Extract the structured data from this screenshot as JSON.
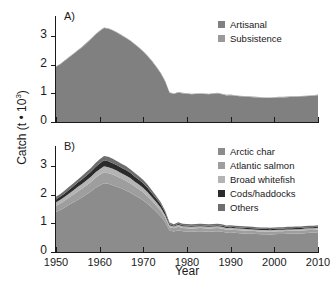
{
  "figure": {
    "axis_title_y": "Catch (t • 10",
    "axis_title_y_exp": "3",
    "axis_title_y_close": ")",
    "axis_title_x": "Year",
    "background": "#ffffff",
    "text_color": "#1a1a1a"
  },
  "panels": [
    {
      "id": "A",
      "label": "A)",
      "ytick_labels": [
        "0",
        "1",
        "2",
        "3"
      ],
      "xtick_labels": [
        "1950",
        "1960",
        "1970",
        "1980",
        "1990",
        "2000",
        "2010"
      ],
      "legend": [
        {
          "label": "Artisanal",
          "color": "#808080"
        },
        {
          "label": "Subsistence",
          "color": "#9a9a9a"
        }
      ]
    },
    {
      "id": "B",
      "label": "B)",
      "ytick_labels": [
        "0",
        "1",
        "2",
        "3"
      ],
      "xtick_labels": [
        "1950",
        "1960",
        "1970",
        "1980",
        "1990",
        "2000",
        "2010"
      ],
      "legend": [
        {
          "label": "Arctic char",
          "color": "#8c8c8c"
        },
        {
          "label": "Atlantic salmon",
          "color": "#9e9e9e"
        },
        {
          "label": "Broad whitefish",
          "color": "#b4b4b4"
        },
        {
          "label": "Cods/haddocks",
          "color": "#2b2b2b"
        },
        {
          "label": "Others",
          "color": "#6e6e6e"
        }
      ]
    }
  ],
  "chart_data": {
    "type": "area",
    "title": "",
    "xlabel": "Year",
    "ylabel": "Catch (t • 10^3)",
    "xlim": [
      1950,
      2010
    ],
    "ylim": [
      0,
      3.5
    ],
    "yticks": [
      0,
      1,
      2,
      3
    ],
    "xticks": [
      1950,
      1960,
      1970,
      1980,
      1990,
      2000,
      2010
    ],
    "grid": false,
    "legend_position": "top-right",
    "panels": [
      {
        "panel": "A",
        "label": "A)",
        "stacked": true,
        "x": [
          1950,
          1951,
          1952,
          1953,
          1954,
          1955,
          1956,
          1957,
          1958,
          1959,
          1960,
          1961,
          1962,
          1963,
          1964,
          1965,
          1966,
          1967,
          1968,
          1969,
          1970,
          1971,
          1972,
          1973,
          1974,
          1975,
          1976,
          1977,
          1978,
          1979,
          1980,
          1981,
          1982,
          1983,
          1984,
          1985,
          1986,
          1987,
          1988,
          1989,
          1990,
          1991,
          1992,
          1993,
          1994,
          1995,
          1996,
          1997,
          1998,
          1999,
          2000,
          2001,
          2002,
          2003,
          2004,
          2005,
          2006,
          2007,
          2008,
          2009,
          2010
        ],
        "series": [
          {
            "name": "Artisanal",
            "color": "#808080",
            "values": [
              1.93,
              2.02,
              2.14,
              2.26,
              2.38,
              2.5,
              2.62,
              2.76,
              2.9,
              3.05,
              3.18,
              3.29,
              3.26,
              3.2,
              3.12,
              3.03,
              2.94,
              2.84,
              2.72,
              2.6,
              2.46,
              2.3,
              2.12,
              1.92,
              1.7,
              1.42,
              1.02,
              0.98,
              1.03,
              1.0,
              0.99,
              0.97,
              0.98,
              0.99,
              0.98,
              0.97,
              0.99,
              1.0,
              0.97,
              0.93,
              0.94,
              0.92,
              0.9,
              0.89,
              0.88,
              0.87,
              0.86,
              0.85,
              0.84,
              0.84,
              0.85,
              0.86,
              0.86,
              0.87,
              0.88,
              0.88,
              0.89,
              0.9,
              0.91,
              0.92,
              0.94
            ]
          },
          {
            "name": "Subsistence",
            "color": "#9a9a9a",
            "values": [
              0.02,
              0.02,
              0.02,
              0.02,
              0.02,
              0.02,
              0.02,
              0.02,
              0.02,
              0.02,
              0.02,
              0.02,
              0.02,
              0.02,
              0.02,
              0.02,
              0.02,
              0.02,
              0.02,
              0.02,
              0.02,
              0.02,
              0.02,
              0.02,
              0.02,
              0.02,
              0.02,
              0.02,
              0.02,
              0.02,
              0.02,
              0.02,
              0.02,
              0.02,
              0.02,
              0.02,
              0.02,
              0.02,
              0.02,
              0.02,
              0.02,
              0.02,
              0.02,
              0.02,
              0.02,
              0.02,
              0.02,
              0.02,
              0.02,
              0.02,
              0.02,
              0.02,
              0.02,
              0.02,
              0.02,
              0.02,
              0.02,
              0.02,
              0.02,
              0.02,
              0.02
            ]
          }
        ]
      },
      {
        "panel": "B",
        "label": "B)",
        "stacked": true,
        "x": [
          1950,
          1951,
          1952,
          1953,
          1954,
          1955,
          1956,
          1957,
          1958,
          1959,
          1960,
          1961,
          1962,
          1963,
          1964,
          1965,
          1966,
          1967,
          1968,
          1969,
          1970,
          1971,
          1972,
          1973,
          1974,
          1975,
          1976,
          1977,
          1978,
          1979,
          1980,
          1981,
          1982,
          1983,
          1984,
          1985,
          1986,
          1987,
          1988,
          1989,
          1990,
          1991,
          1992,
          1993,
          1994,
          1995,
          1996,
          1997,
          1998,
          1999,
          2000,
          2001,
          2002,
          2003,
          2004,
          2005,
          2006,
          2007,
          2008,
          2009,
          2010
        ],
        "series": [
          {
            "name": "Arctic char",
            "color": "#8c8c8c",
            "values": [
              1.4,
              1.47,
              1.56,
              1.65,
              1.74,
              1.83,
              1.92,
              2.02,
              2.12,
              2.24,
              2.33,
              2.41,
              2.39,
              2.34,
              2.28,
              2.22,
              2.15,
              2.08,
              1.99,
              1.9,
              1.8,
              1.68,
              1.55,
              1.4,
              1.24,
              1.04,
              0.75,
              0.72,
              0.76,
              0.73,
              0.72,
              0.71,
              0.72,
              0.73,
              0.72,
              0.71,
              0.72,
              0.73,
              0.71,
              0.68,
              0.69,
              0.67,
              0.66,
              0.65,
              0.64,
              0.64,
              0.63,
              0.62,
              0.62,
              0.61,
              0.62,
              0.63,
              0.63,
              0.64,
              0.64,
              0.65,
              0.65,
              0.66,
              0.67,
              0.67,
              0.69
            ]
          },
          {
            "name": "Atlantic salmon",
            "color": "#9e9e9e",
            "values": [
              0.22,
              0.23,
              0.24,
              0.26,
              0.27,
              0.29,
              0.3,
              0.32,
              0.33,
              0.35,
              0.37,
              0.38,
              0.37,
              0.37,
              0.36,
              0.35,
              0.34,
              0.33,
              0.31,
              0.3,
              0.28,
              0.26,
              0.24,
              0.22,
              0.2,
              0.16,
              0.12,
              0.11,
              0.12,
              0.11,
              0.11,
              0.11,
              0.11,
              0.11,
              0.11,
              0.11,
              0.11,
              0.11,
              0.11,
              0.1,
              0.1,
              0.1,
              0.1,
              0.1,
              0.1,
              0.1,
              0.1,
              0.1,
              0.1,
              0.1,
              0.1,
              0.1,
              0.1,
              0.1,
              0.1,
              0.1,
              0.1,
              0.1,
              0.1,
              0.1,
              0.1
            ]
          },
          {
            "name": "Broad whitefish",
            "color": "#b4b4b4",
            "values": [
              0.12,
              0.13,
              0.13,
              0.14,
              0.15,
              0.16,
              0.17,
              0.17,
              0.18,
              0.19,
              0.2,
              0.21,
              0.21,
              0.2,
              0.2,
              0.19,
              0.19,
              0.18,
              0.17,
              0.16,
              0.16,
              0.15,
              0.13,
              0.12,
              0.11,
              0.09,
              0.07,
              0.06,
              0.07,
              0.06,
              0.06,
              0.06,
              0.06,
              0.06,
              0.06,
              0.06,
              0.06,
              0.06,
              0.06,
              0.06,
              0.06,
              0.06,
              0.06,
              0.06,
              0.06,
              0.05,
              0.05,
              0.05,
              0.05,
              0.05,
              0.05,
              0.05,
              0.05,
              0.05,
              0.05,
              0.05,
              0.05,
              0.06,
              0.06,
              0.06,
              0.06
            ]
          },
          {
            "name": "Cods/haddocks",
            "color": "#2b2b2b",
            "values": [
              0.1,
              0.11,
              0.12,
              0.13,
              0.14,
              0.15,
              0.16,
              0.17,
              0.18,
              0.19,
              0.2,
              0.21,
              0.21,
              0.2,
              0.2,
              0.19,
              0.19,
              0.18,
              0.17,
              0.17,
              0.16,
              0.15,
              0.13,
              0.12,
              0.11,
              0.09,
              0.04,
              0.03,
              0.04,
              0.04,
              0.04,
              0.04,
              0.04,
              0.04,
              0.04,
              0.04,
              0.04,
              0.04,
              0.04,
              0.04,
              0.04,
              0.04,
              0.04,
              0.04,
              0.04,
              0.04,
              0.04,
              0.04,
              0.04,
              0.04,
              0.04,
              0.04,
              0.04,
              0.04,
              0.04,
              0.04,
              0.04,
              0.04,
              0.04,
              0.04,
              0.04
            ]
          },
          {
            "name": "Others",
            "color": "#6e6e6e",
            "values": [
              0.09,
              0.09,
              0.1,
              0.1,
              0.11,
              0.11,
              0.12,
              0.13,
              0.13,
              0.14,
              0.15,
              0.15,
              0.15,
              0.15,
              0.14,
              0.14,
              0.14,
              0.13,
              0.13,
              0.12,
              0.12,
              0.11,
              0.1,
              0.09,
              0.08,
              0.06,
              0.05,
              0.05,
              0.05,
              0.05,
              0.05,
              0.05,
              0.05,
              0.05,
              0.05,
              0.05,
              0.05,
              0.05,
              0.05,
              0.05,
              0.05,
              0.05,
              0.05,
              0.05,
              0.05,
              0.05,
              0.05,
              0.05,
              0.05,
              0.05,
              0.05,
              0.05,
              0.05,
              0.05,
              0.05,
              0.05,
              0.05,
              0.05,
              0.05,
              0.05,
              0.05
            ]
          }
        ]
      }
    ]
  }
}
